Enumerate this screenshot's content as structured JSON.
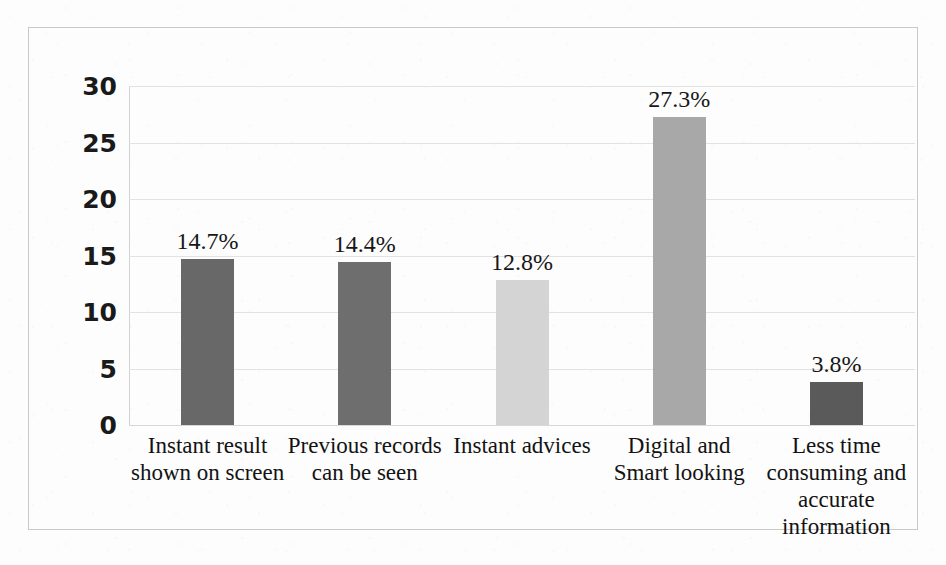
{
  "chart_data": {
    "type": "bar",
    "title": "",
    "subtitle": "",
    "xlabel": "",
    "ylabel": "",
    "ylim": [
      0,
      30
    ],
    "ytick_step": 5,
    "ytick_labels": [
      "30",
      "25",
      "20",
      "15",
      "10",
      "5",
      "0"
    ],
    "grid": true,
    "legend": "none",
    "categories": [
      "Instant result shown on screen",
      "Previous records can be seen",
      "Instant advices",
      "Digital and Smart looking",
      "Less time consuming and accurate information"
    ],
    "category_lines": [
      [
        "Instant result",
        "shown on screen"
      ],
      [
        "Previous records",
        "can be seen"
      ],
      [
        "Instant advices"
      ],
      [
        "Digital and",
        "Smart looking"
      ],
      [
        "Less time",
        "consuming and",
        "accurate",
        "information"
      ]
    ],
    "values": [
      14.7,
      14.4,
      12.8,
      27.3,
      3.8
    ],
    "data_labels": [
      "14.7%",
      "14.4%",
      "12.8%",
      "27.3%",
      "3.8%"
    ],
    "bar_colors": [
      "#686868",
      "#6e6e6e",
      "#d4d4d4",
      "#a8a8a8",
      "#5a5a5a"
    ]
  },
  "style": {
    "frame_border": "#c9c9c9",
    "gridline": "#e2e2e2",
    "axis_text": "#1a1a1a",
    "label_text": "#131313",
    "background": "#fdfdfd"
  }
}
